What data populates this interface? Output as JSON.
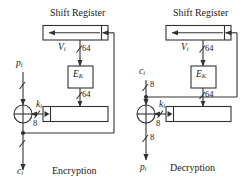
{
  "figure": {
    "type": "cfb-mode-block-diagram",
    "stroke_color": "#333333",
    "fill_color": "#ffffff",
    "background": "#ffffff"
  },
  "panels": [
    {
      "id": "encryption",
      "caption": "Encryption",
      "shift_register_label": "Shift Register",
      "cipher_box_label": "E",
      "cipher_box_sub": "K",
      "feedback_signal": "V",
      "feedback_signal_sub": "i",
      "feedback_width": "64",
      "cipher_out_width": "64",
      "key_label": "k",
      "key_label_sub": "i",
      "key_width": "8",
      "input_label": "p",
      "input_label_sub": "i",
      "input_width": "",
      "output_label": "c",
      "output_label_sub": "i",
      "output_width": ""
    },
    {
      "id": "decryption",
      "caption": "Decryption",
      "shift_register_label": "Shift Register",
      "cipher_box_label": "E",
      "cipher_box_sub": "K",
      "feedback_signal": "V",
      "feedback_signal_sub": "i",
      "feedback_width": "64",
      "cipher_out_width": "64",
      "key_label": "k",
      "key_label_sub": "i",
      "key_width": "8",
      "input_label": "c",
      "input_label_sub": "i",
      "input_width": "8",
      "output_label": "p",
      "output_label_sub": "i",
      "output_width": "8"
    }
  ]
}
